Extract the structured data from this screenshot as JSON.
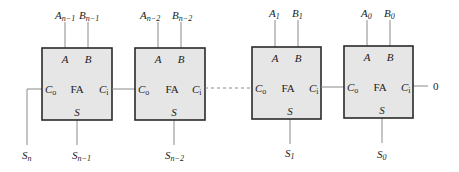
{
  "diagram": {
    "adders": [
      {
        "label": "FA",
        "in_a": "A",
        "in_b": "B",
        "carry_out": "C",
        "carry_out_sub": "o",
        "carry_in": "C",
        "carry_in_sub": "i",
        "sum": "S",
        "a_name": "A",
        "a_sub": "n−1",
        "b_name": "B",
        "b_sub": "n−1",
        "s_name": "S",
        "s_sub": "n−1"
      },
      {
        "label": "FA",
        "in_a": "A",
        "in_b": "B",
        "carry_out": "C",
        "carry_out_sub": "o",
        "carry_in": "C",
        "carry_in_sub": "i",
        "sum": "S",
        "a_name": "A",
        "a_sub": "n−2",
        "b_name": "B",
        "b_sub": "n−2",
        "s_name": "S",
        "s_sub": "n−2"
      },
      {
        "label": "FA",
        "in_a": "A",
        "in_b": "B",
        "carry_out": "C",
        "carry_out_sub": "o",
        "carry_in": "C",
        "carry_in_sub": "i",
        "sum": "S",
        "a_name": "A",
        "a_sub": "1",
        "b_name": "B",
        "b_sub": "1",
        "s_name": "S",
        "s_sub": "1"
      },
      {
        "label": "FA",
        "in_a": "A",
        "in_b": "B",
        "carry_out": "C",
        "carry_out_sub": "o",
        "carry_in": "C",
        "carry_in_sub": "i",
        "sum": "S",
        "a_name": "A",
        "a_sub": "0",
        "b_name": "B",
        "b_sub": "0",
        "s_name": "S",
        "s_sub": "0"
      }
    ],
    "final_carry": {
      "name": "S",
      "sub": "n"
    },
    "carry_in_value": "0",
    "colors": {
      "box_fill": "#e6e6e6",
      "box_stroke": "#2a2a2a",
      "wire": "#8a8a8a"
    }
  }
}
